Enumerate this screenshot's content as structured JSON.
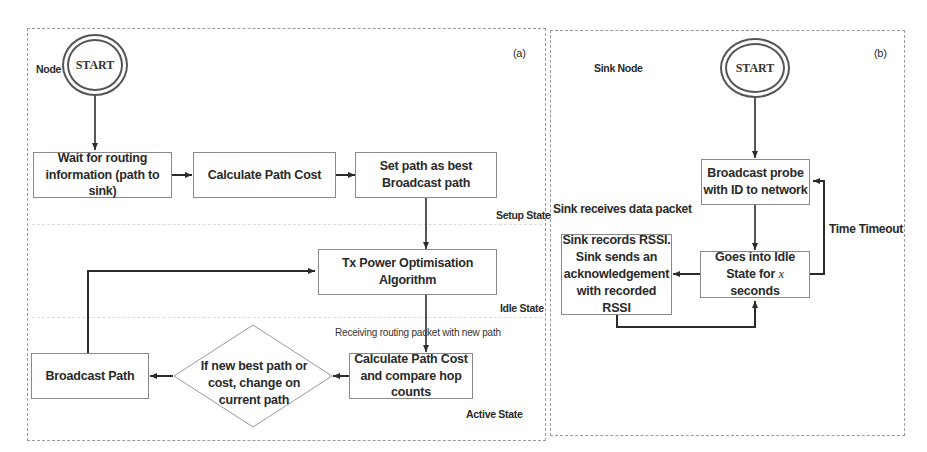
{
  "panel_a": {
    "tag": "(a)",
    "node_label": "Node",
    "start_label": "START",
    "boxes": {
      "wait": "Wait for routing information (path to sink)",
      "calc_cost": "Calculate Path Cost",
      "set_path": "Set path as best Broadcast path",
      "tx_power": "Tx Power Optimisation Algorithm",
      "calc_compare": "Calculate Path Cost and compare hop counts",
      "broadcast": "Broadcast Path"
    },
    "decision": "If new best path or cost, change on current path",
    "states": {
      "setup": "Setup State",
      "idle": "Idle State",
      "active": "Active State"
    },
    "edge_labels": {
      "receiving": "Receiving routing packet with new path"
    }
  },
  "panel_b": {
    "tag": "(b)",
    "node_label": "Sink Node",
    "start_label": "START",
    "boxes": {
      "broadcast_probe": "Broadcast probe with ID to network",
      "idle": "Goes into Idle State for x seconds",
      "record_rssi_l1": "Sink records RSSI.",
      "record_rssi_l2": "Sink sends an",
      "record_rssi_l3": "acknowledgement",
      "record_rssi_l4": "with recorded RSSI"
    },
    "idle_l1": "Goes into Idle",
    "idle_l2_pre": "State for ",
    "idle_l2_var": "x",
    "idle_l2_post": " seconds",
    "edge_labels": {
      "receives": "Sink receives data packet",
      "timeout": "Time Timeout"
    }
  },
  "colors": {
    "line": "#2b2b2b",
    "box_border": "#8a8a8a",
    "panel_border": "#9a9a9a",
    "separator": "#dcdcdc"
  }
}
